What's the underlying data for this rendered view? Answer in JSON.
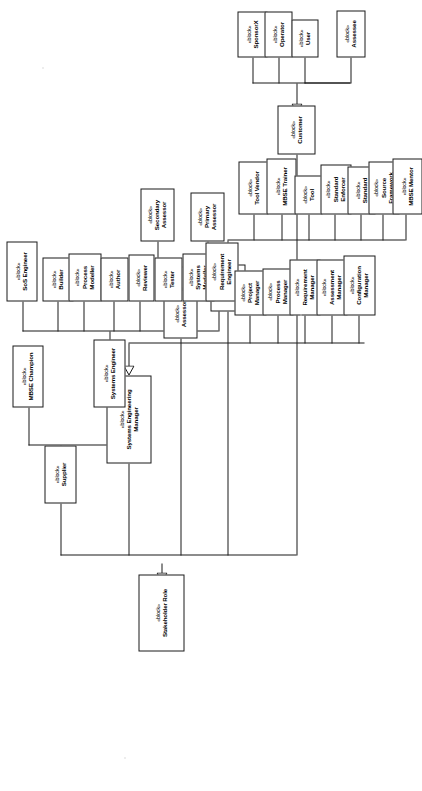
{
  "diagram": {
    "type": "sysml-block-definition-diagram",
    "orientation": "rotated-90-ccw",
    "stereotype": "«block»",
    "root": "Stakeholder Role",
    "relationship": "generalization"
  },
  "blocks": {
    "stakeholder_role": {
      "stereotype": "«block»",
      "name": "Stakeholder Role"
    },
    "supplier": {
      "stereotype": "«block»",
      "name": "Supplier"
    },
    "systems_engineering_manager": {
      "stereotype": "«block»",
      "name": "Systems Engineering Manager"
    },
    "assessor": {
      "stereotype": "«block»",
      "name": "Assessor"
    },
    "external": {
      "stereotype": "«block»",
      "name": "External"
    },
    "customer": {
      "stereotype": "«block»",
      "name": "Customer"
    },
    "mbse_champion": {
      "stereotype": "«block»",
      "name": "MBSE Champion"
    },
    "systems_engineer": {
      "stereotype": "«block»",
      "name": "Systems Engineer"
    },
    "sos_engineer": {
      "stereotype": "«block»",
      "name": "SoS Engineer"
    },
    "builder": {
      "stereotype": "«block»",
      "name": "Builder"
    },
    "process_modeller": {
      "stereotype": "«block»",
      "name": "Process Modeller",
      "line1": "Process",
      "line2": "Modeller"
    },
    "author": {
      "stereotype": "«block»",
      "name": "Author"
    },
    "reviewer": {
      "stereotype": "«block»",
      "name": "Reviewer"
    },
    "tester": {
      "stereotype": "«block»",
      "name": "Tester"
    },
    "systems_modeller": {
      "stereotype": "«block»",
      "name": "Systems Modeller",
      "line1": "Systems",
      "line2": "Modeller"
    },
    "requirement_engineer": {
      "stereotype": "«block»",
      "name": "Requirement Engineer",
      "line1": "Requirement",
      "line2": "Engineer"
    },
    "secondary_assessor": {
      "stereotype": "«block»",
      "name": "Secondary Assessor",
      "line1": "Secondary",
      "line2": "Assessor"
    },
    "primary_assessor": {
      "stereotype": "«block»",
      "name": "Primary Assessor",
      "line1": "Primary",
      "line2": "Assessor"
    },
    "project_manager": {
      "stereotype": "«block»",
      "name": "Project Manager",
      "line1": "Project",
      "line2": "Manager"
    },
    "process_manager": {
      "stereotype": "«block»",
      "name": "Process Manager",
      "line1": "Process",
      "line2": "Manager"
    },
    "requirement_manager": {
      "stereotype": "«block»",
      "name": "Requirement Manager",
      "line1": "Requirement",
      "line2": "Manager"
    },
    "assessment_manager": {
      "stereotype": "«block»",
      "name": "Assessment Manager",
      "line1": "Assessment",
      "line2": "Manager"
    },
    "configuration_manager": {
      "stereotype": "«block»",
      "name": "Configuration Manager",
      "line1": "Configuration",
      "line2": "Manager"
    },
    "tool_vendor": {
      "stereotype": "«block»",
      "name": "Tool Vendor"
    },
    "mbse_trainer": {
      "stereotype": "«block»",
      "name": "MBSE Trainer"
    },
    "tool": {
      "stereotype": "«block»",
      "name": "Tool"
    },
    "standard_enforcer": {
      "stereotype": "«block»",
      "name": "Standard Enforcer",
      "line1": "Standard",
      "line2": "Enforcer"
    },
    "standard": {
      "stereotype": "«block»",
      "name": "Standard"
    },
    "source_framework": {
      "stereotype": "«block»",
      "name": "Source Framework",
      "line1": "Source",
      "line2": "Framework"
    },
    "mbse_mentor": {
      "stereotype": "«block»",
      "name": "MBSE Mentor"
    },
    "sponsorx": {
      "stereotype": "«block»",
      "name": "SponsorX"
    },
    "operator": {
      "stereotype": "«block»",
      "name": "Operator"
    },
    "user": {
      "stereotype": "«block»",
      "name": "User"
    },
    "assessee": {
      "stereotype": "«block»",
      "name": "Assessee"
    }
  },
  "colors": {
    "line": "#1a1a1a",
    "box_fill": "#ffffff",
    "text": "#000000",
    "page": "#ffffff"
  }
}
